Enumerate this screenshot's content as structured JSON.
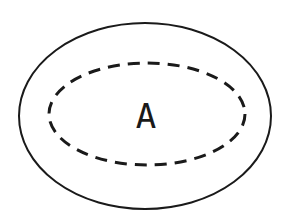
{
  "diagram": {
    "outer_region": {
      "style": "solid",
      "color": "#1a1a1a"
    },
    "inner_region": {
      "style": "dashed",
      "color": "#1a1a1a",
      "label": "A"
    }
  }
}
